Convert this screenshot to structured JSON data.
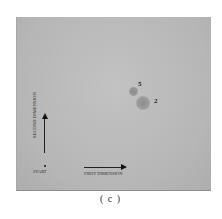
{
  "figure": {
    "caption": "( c )",
    "plate": {
      "background_color": "#b9b9b9",
      "spots": [
        {
          "id": "5",
          "label": "5",
          "x": 134,
          "y": 92,
          "radius": 4
        },
        {
          "id": "2",
          "label": "2",
          "x": 143,
          "y": 103,
          "radius": 7
        }
      ],
      "start_label": "START",
      "first_dimension_label": "FIRST DIMENSION",
      "second_dimension_label": "SECOND DIMENSION"
    }
  }
}
